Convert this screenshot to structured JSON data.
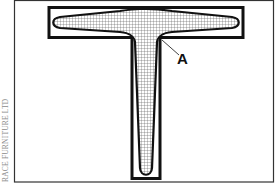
{
  "diagram": {
    "callout_label": "A",
    "credit": "RACE FURNITURE LTD",
    "colors": {
      "outline": "#111111",
      "frame": "#333333",
      "hatch_fill": "#ffffff",
      "hatch_lines": "#555555",
      "credit_text": "#8a8a8a"
    }
  }
}
